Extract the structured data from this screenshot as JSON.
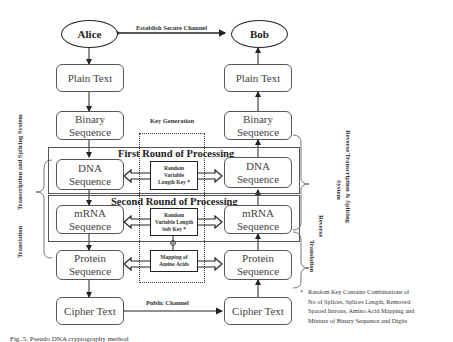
{
  "parties": {
    "sender": "Alice",
    "receiver": "Bob"
  },
  "channels": {
    "secure": "Establish Secure Channel",
    "public": "Public Channel"
  },
  "sender_column": [
    {
      "id": "plain",
      "label": "Plain Text"
    },
    {
      "id": "binary",
      "label": "Binary Sequence",
      "line1": "Binary",
      "line2": "Sequence"
    },
    {
      "id": "dna",
      "label": "DNA Sequence",
      "line1": "DNA",
      "line2": "Sequence"
    },
    {
      "id": "mrna",
      "label": "mRNA Sequence",
      "line1": "mRNA",
      "line2": "Sequence"
    },
    {
      "id": "protein",
      "label": "Protein Sequence",
      "line1": "Protein",
      "line2": "Sequence"
    },
    {
      "id": "cipher",
      "label": "Cipher Text"
    }
  ],
  "receiver_column": [
    {
      "id": "plain",
      "label": "Plain Text"
    },
    {
      "id": "binary",
      "label": "Binary Sequence",
      "line1": "Binary",
      "line2": "Sequence"
    },
    {
      "id": "dna",
      "label": "DNA Sequence",
      "line1": "DNA",
      "line2": "Sequence"
    },
    {
      "id": "mrna",
      "label": "mRNA Sequence",
      "line1": "mRNA",
      "line2": "Sequence"
    },
    {
      "id": "protein",
      "label": "Protein Sequence",
      "line1": "Protein",
      "line2": "Sequence"
    },
    {
      "id": "cipher",
      "label": "Cipher Text"
    }
  ],
  "key_generation": {
    "title": "Key Generation",
    "keys": [
      {
        "line1": "Random",
        "line2": "Variable",
        "line3": "Length Key *"
      },
      {
        "line1": "Random",
        "line2": "Variable Length",
        "line3": "Sub Key *"
      },
      {
        "line1": "Mapping of",
        "line2": "Amino Acids"
      }
    ],
    "combine_symbol": "⊕"
  },
  "rounds": {
    "first": "First Round of Processing",
    "second": "Second Round of Processing"
  },
  "side_labels": {
    "left_top": "Transcription and Splicing System",
    "left_bottom": "Translation",
    "right_top_line1": "Reverse Transcription & Splicing",
    "right_top_line2": "System",
    "right_bottom_line1": "Reverse",
    "right_bottom_line2": "Translation"
  },
  "footnote": {
    "marker": "*",
    "lines": [
      "Random Key Contains Combinations of",
      "No of Splices, Splices Length, Removed",
      "Spaced Introns, Amino Acid Mapping and",
      "Mixture of Binary Sequence and Digits"
    ]
  },
  "caption": "Fig. 5. Pseudo DNA cryptography method"
}
